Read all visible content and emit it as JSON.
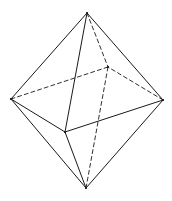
{
  "figure": {
    "stroke_color": "#1a1a1a",
    "background": "#ffffff",
    "vertices": {
      "top": [
        87,
        13
      ],
      "left": [
        11,
        99
      ],
      "right": [
        163,
        100
      ],
      "front": [
        65,
        132
      ],
      "back": [
        108,
        67
      ],
      "bottom": [
        86,
        188
      ]
    },
    "visible_edges": [
      [
        "top",
        "left"
      ],
      [
        "top",
        "right"
      ],
      [
        "top",
        "front"
      ],
      [
        "left",
        "front"
      ],
      [
        "right",
        "front"
      ],
      [
        "left",
        "bottom"
      ],
      [
        "right",
        "bottom"
      ],
      [
        "front",
        "bottom"
      ]
    ],
    "hidden_edges": [
      [
        "top",
        "back"
      ],
      [
        "left",
        "back"
      ],
      [
        "right",
        "back"
      ],
      [
        "back",
        "bottom"
      ]
    ]
  }
}
